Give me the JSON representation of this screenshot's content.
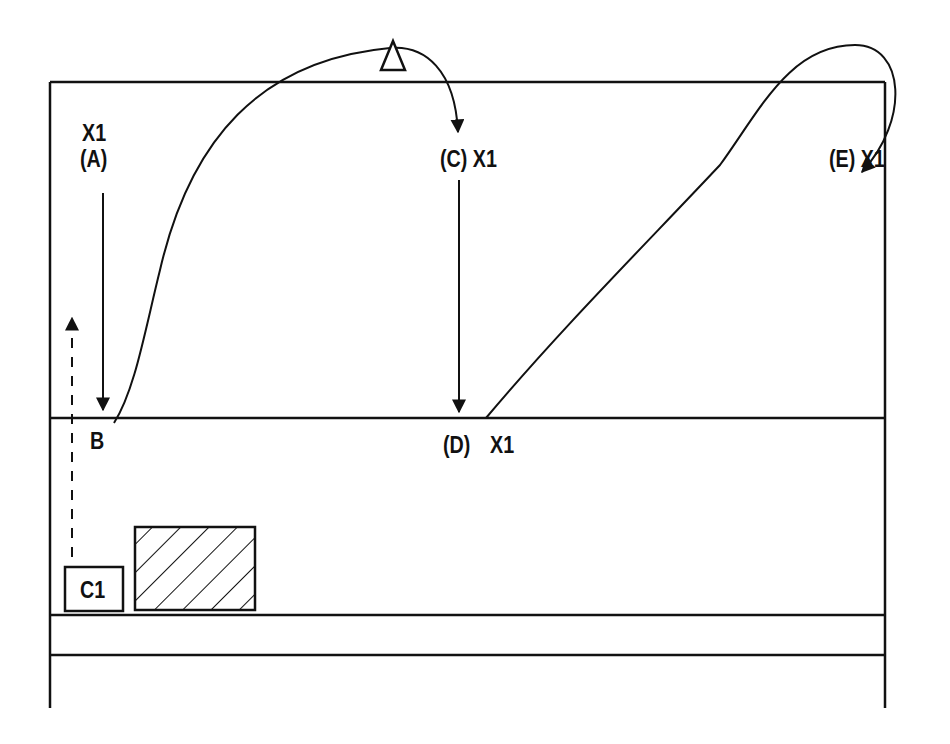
{
  "diagram": {
    "title": "",
    "colors": {
      "line": "#111111",
      "background": "#ffffff"
    },
    "labels": {
      "a_player": "X1",
      "a_position": "(A)",
      "b": "B",
      "c": "(C) X1",
      "d_position": "(D)",
      "d_player": "X1",
      "e": "(E) X1",
      "cone_box": "C1"
    },
    "elements": [
      {
        "type": "court-outline",
        "note": "outer boundary with left, right, top lines"
      },
      {
        "type": "line",
        "name": "attack-line",
        "y": 418
      },
      {
        "type": "line",
        "name": "center-line",
        "y": 615
      },
      {
        "type": "line",
        "name": "lower-line",
        "y": 655
      },
      {
        "type": "arrow",
        "from": "A",
        "to": "B",
        "style": "solid"
      },
      {
        "type": "curve-arrow",
        "from": "B",
        "to": "C",
        "via": "triangle-marker"
      },
      {
        "type": "arrow",
        "from": "C",
        "to": "D",
        "style": "solid"
      },
      {
        "type": "curve-arrow",
        "from": "D",
        "to": "E"
      },
      {
        "type": "arrow",
        "from": "C1",
        "to": "up",
        "style": "dashed"
      },
      {
        "type": "box",
        "label": "C1"
      },
      {
        "type": "hatched-box",
        "name": "target-area"
      },
      {
        "type": "triangle-marker",
        "name": "coach-marker"
      }
    ]
  }
}
